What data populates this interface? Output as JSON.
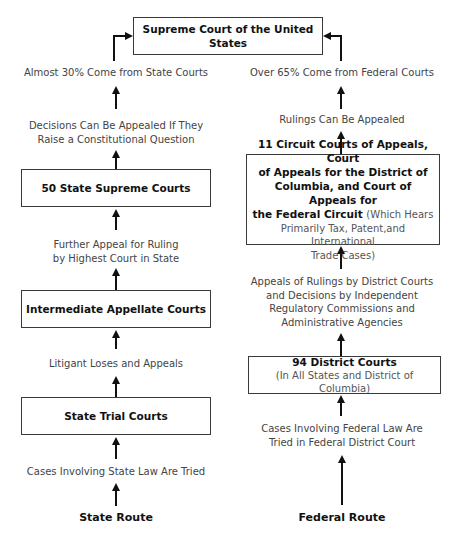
{
  "supreme_court": {
    "label": "Supreme Court of the United States"
  },
  "state": {
    "share_label": "Almost 30% Come from State Courts",
    "appeal_condition": [
      "Decisions Can Be Appealed If They",
      "Raise a Constitutional Question"
    ],
    "supreme_courts": "50 State Supreme Courts",
    "further_appeal": [
      "Further Appeal for Ruling",
      "by Highest Court in State"
    ],
    "intermediate_courts": "Intermediate Appellate Courts",
    "litigant_appeals": "Litigant Loses and Appeals",
    "trial_courts": "State Trial Courts",
    "cases_tried": "Cases Involving State Law Are Tried",
    "route_label": "State Route"
  },
  "federal": {
    "share_label": "Over 65% Come from Federal Courts",
    "rulings_appealed": "Rulings Can Be Appealed",
    "circuit_courts": {
      "bold": [
        "11 Circuit Courts of Appeals, Court",
        "of Appeals for the District of",
        "Columbia, and Court of Appeals for",
        "the Federal Circuit"
      ],
      "light_inline": "(Which Hears",
      "light": [
        "Primarily Tax, Patent,and International",
        "Trade Cases)"
      ]
    },
    "appeals_of_rulings": [
      "Appeals of Rulings by District Courts",
      "and Decisions by Independent",
      "Regulatory Commissions and",
      "Administrative Agencies"
    ],
    "district_courts": {
      "title": "94 District Courts",
      "subtitle": "(In All States and District of Columbia)"
    },
    "cases_tried": [
      "Cases Involving Federal Law Are",
      "Tried in Federal District Court"
    ],
    "route_label": "Federal Route"
  }
}
